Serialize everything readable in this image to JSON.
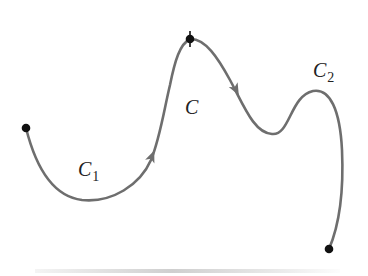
{
  "figure": {
    "colors": {
      "curve": "#6e6e6e",
      "points": "#111111",
      "text": "#222222"
    },
    "labels": {
      "c": {
        "main": "C",
        "sub": ""
      },
      "c1": {
        "main": "C",
        "sub": "1"
      },
      "c2": {
        "main": "C",
        "sub": "2"
      }
    },
    "points": [
      {
        "name": "start",
        "x": 26,
        "y": 128
      },
      {
        "name": "junction",
        "x": 190,
        "y": 39
      },
      {
        "name": "end",
        "x": 329,
        "y": 249
      }
    ],
    "arrows": [
      {
        "on": "C1",
        "direction": "up",
        "x": 152,
        "y": 155
      },
      {
        "on": "C2",
        "direction": "down",
        "x": 236,
        "y": 90
      }
    ]
  }
}
